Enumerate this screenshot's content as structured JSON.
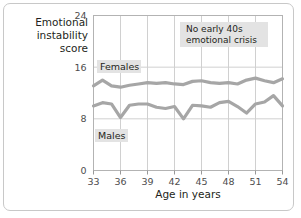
{
  "chart_data": {
    "type": "line",
    "title": "",
    "xlabel": "Age in years",
    "ylabel": "Emotional instability score",
    "xlim": [
      33,
      54
    ],
    "ylim": [
      0,
      24
    ],
    "xticks": [
      33,
      36,
      39,
      42,
      45,
      48,
      51,
      54
    ],
    "yticks": [
      0,
      8,
      16,
      24
    ],
    "grid": "vertical-and-horizontal",
    "legend": "inline-labels",
    "x": [
      33,
      34,
      35,
      36,
      37,
      38,
      39,
      40,
      41,
      42,
      43,
      44,
      45,
      46,
      47,
      48,
      49,
      50,
      51,
      52,
      53,
      54
    ],
    "series": [
      {
        "name": "Females",
        "color": "#a6a6a6",
        "values": [
          13.1,
          14.0,
          13.1,
          12.9,
          13.2,
          13.4,
          13.6,
          13.5,
          13.6,
          13.4,
          13.3,
          13.8,
          13.9,
          13.6,
          13.5,
          13.6,
          13.4,
          14.0,
          14.3,
          13.9,
          13.6,
          14.2
        ]
      },
      {
        "name": "Males",
        "color": "#a6a6a6",
        "values": [
          10.0,
          10.5,
          10.3,
          8.2,
          10.1,
          10.3,
          10.3,
          9.8,
          9.6,
          9.9,
          8.0,
          10.1,
          10.0,
          9.8,
          10.5,
          10.7,
          9.9,
          8.9,
          10.3,
          10.6,
          11.6,
          10.0
        ]
      }
    ],
    "annotations": [
      {
        "id": "no-crisis",
        "text_line1": "No early 40s",
        "text_line2": "emotional crisis"
      },
      {
        "id": "females-label",
        "text": "Females"
      },
      {
        "id": "males-label",
        "text": "Males"
      }
    ],
    "xtick_labels": [
      "33",
      "36",
      "39",
      "42",
      "45",
      "48",
      "51",
      "54"
    ],
    "ytick_labels": [
      "0",
      "8",
      "16",
      "24"
    ]
  },
  "axes": {
    "y_title_line1": "Emotional",
    "y_title_line2": "instability",
    "y_title_line3": "score",
    "x_title": "Age in years"
  }
}
